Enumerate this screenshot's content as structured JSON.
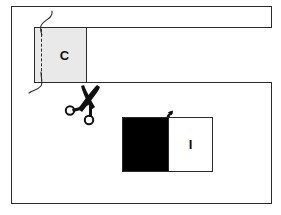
{
  "figure": {
    "frame": {
      "border_color": "#2b2b2b",
      "background": "#ffffff"
    },
    "fabric_band": {
      "name": "fabric-strip",
      "fill": "#ffffff",
      "edge_color": "#2b2b2b"
    },
    "patch_c": {
      "label": "C",
      "fill": "#e9e9e9",
      "edge_color": "#2b2b2b",
      "stitch_style": "dashed",
      "stitch_color": "#2b2b2b"
    },
    "thread": {
      "name": "thread-curve",
      "color": "#2b2b2b"
    },
    "scissors": {
      "name": "scissors-icon",
      "color": "#111111"
    },
    "pieced_unit": {
      "label": "I",
      "dark_fill": "#000000",
      "light_fill": "#ffffff",
      "edge_color": "#2b2b2b",
      "seam_marker": "arrow"
    }
  }
}
